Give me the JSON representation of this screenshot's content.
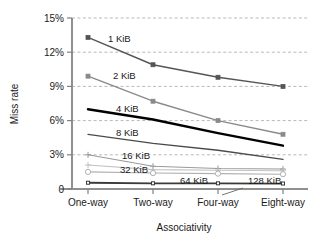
{
  "chart_data": {
    "type": "line",
    "title": "",
    "xlabel": "Associativity",
    "ylabel": "Miss rate",
    "categories": [
      "One-way",
      "Two-way",
      "Four-way",
      "Eight-way"
    ],
    "x_positions": [
      88,
      153,
      218,
      283
    ],
    "ylim": [
      0,
      15
    ],
    "ytick_values": [
      0,
      3,
      6,
      9,
      12,
      15
    ],
    "ytick_labels": [
      "0",
      "3%",
      "6%",
      "9%",
      "12%",
      "15%"
    ],
    "grid": "horizontal-dashed",
    "legend": "inline-labels",
    "series": [
      {
        "name": "1 KiB",
        "label": "1 KiB",
        "color": "#555555",
        "width": 1.4,
        "marker": "square",
        "marker_size": 4,
        "marker_fill": "#555555",
        "label_x": 108,
        "label_y": 42,
        "values": [
          13.3,
          10.9,
          9.8,
          9.0
        ]
      },
      {
        "name": "2 KiB",
        "label": "2 KiB",
        "color": "#8a8a8a",
        "width": 1.4,
        "marker": "square",
        "marker_size": 4,
        "marker_fill": "#8a8a8a",
        "label_x": 113,
        "label_y": 79,
        "values": [
          9.9,
          7.7,
          6.0,
          4.8
        ]
      },
      {
        "name": "4 KiB",
        "label": "4 KiB",
        "color": "#000000",
        "width": 2.4,
        "marker": "none",
        "marker_size": 0,
        "marker_fill": "#000000",
        "label_x": 116,
        "label_y": 112,
        "values": [
          7.0,
          6.1,
          4.9,
          3.8
        ]
      },
      {
        "name": "8 KiB",
        "label": "8 KiB",
        "color": "#4a4a4a",
        "width": 1.3,
        "marker": "none",
        "marker_size": 0,
        "marker_fill": "#4a4a4a",
        "label_x": 116,
        "label_y": 136,
        "values": [
          4.8,
          4.0,
          3.4,
          2.6
        ]
      },
      {
        "name": "16 KiB",
        "label": "16 KiB",
        "color": "#9a9a9a",
        "width": 1.1,
        "marker": "plus",
        "marker_size": 3,
        "marker_fill": "#9a9a9a",
        "label_x": 122,
        "label_y": 159,
        "values": [
          3.0,
          2.0,
          1.8,
          1.75
        ]
      },
      {
        "name": "32 KiB",
        "label": "32 KiB",
        "color": "#c2c2c2",
        "width": 1.1,
        "marker": "plus",
        "marker_size": 3,
        "marker_fill": "#c2c2c2",
        "label_x": 120,
        "label_y": 173,
        "values": [
          2.1,
          1.7,
          1.65,
          1.6
        ]
      },
      {
        "name": "64 KiB",
        "label": "64 KiB",
        "color": "#b0b0b0",
        "width": 1.1,
        "marker": "circle",
        "marker_size": 2.6,
        "marker_fill": "#ffffff",
        "label_x": 180,
        "label_y": 184,
        "values": [
          1.5,
          1.4,
          1.35,
          1.3
        ]
      },
      {
        "name": "128 KiB",
        "label": "128 KiB",
        "color": "#3a3a3a",
        "width": 1.8,
        "marker": "square-open",
        "marker_size": 3,
        "marker_fill": "#ffffff",
        "label_x": 248,
        "label_y": 184,
        "values": [
          0.55,
          0.5,
          0.5,
          0.48
        ]
      }
    ],
    "annotations": [
      {
        "name": "leader-128kib",
        "from_x": 243,
        "from_y": 188,
        "to_x": 222,
        "to_y": 195
      }
    ]
  }
}
